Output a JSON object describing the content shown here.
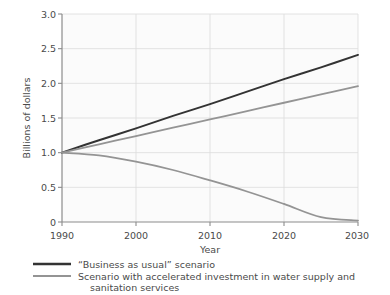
{
  "chart_data": {
    "type": "line",
    "title": "",
    "subtitle": "",
    "xlabel": "Year",
    "ylabel": "Billions of dollars",
    "xlim": [
      1990,
      2030
    ],
    "ylim": [
      0,
      3.0
    ],
    "grid": true,
    "legend_position": "bottom-left",
    "x_ticks": [
      "1990",
      "2000",
      "2010",
      "2020",
      "2030"
    ],
    "x_tick_values": [
      1990,
      2000,
      2010,
      2020,
      2030
    ],
    "y_ticks": [
      "0",
      "0.5",
      "1.0",
      "1.5",
      "2.0",
      "2.5",
      "3.0"
    ],
    "y_tick_values": [
      0,
      0.5,
      1.0,
      1.5,
      2.0,
      2.5,
      3.0
    ],
    "x": [
      1990,
      1995,
      2000,
      2005,
      2010,
      2015,
      2020,
      2025,
      2030
    ],
    "series": [
      {
        "name": "“Business as usual” scenario",
        "color": "#333333",
        "width": 2.0,
        "values": [
          1.0,
          1.18,
          1.35,
          1.53,
          1.7,
          1.88,
          2.06,
          2.23,
          2.41
        ]
      },
      {
        "name": "Scenario with accelerated investment in water supply and sanitation services",
        "color": "#949494",
        "width": 1.8,
        "values": [
          1.0,
          1.12,
          1.24,
          1.36,
          1.48,
          1.6,
          1.72,
          1.84,
          1.96
        ],
        "legend_only": true
      },
      {
        "name": "Scenario with accelerated investment in water supply and sanitation services (declining)",
        "color": "#949494",
        "width": 1.8,
        "values": [
          1.0,
          0.96,
          0.87,
          0.75,
          0.6,
          0.44,
          0.26,
          0.07,
          0.02
        ],
        "legend_hidden": true
      }
    ],
    "annotations": []
  },
  "axes": {
    "y_label": "Billions of dollars",
    "x_label": "Year",
    "y_tick_0": "0",
    "y_tick_1": "0.5",
    "y_tick_2": "1.0",
    "y_tick_3": "1.5",
    "y_tick_4": "2.0",
    "y_tick_5": "2.5",
    "y_tick_6": "3.0",
    "x_tick_0": "1990",
    "x_tick_1": "2000",
    "x_tick_2": "2010",
    "x_tick_3": "2020",
    "x_tick_4": "2030"
  },
  "legend": {
    "item1": {
      "label": "“Business as usual” scenario",
      "color": "#333333"
    },
    "item2": {
      "label_line1": "Scenario with accelerated investment in water supply and",
      "label_line2": "sanitation services",
      "color": "#949494"
    }
  },
  "colors": {
    "background": "#ffffff",
    "plot_background": "#fbfbfb",
    "grid": "#dcdcdc",
    "axis": "#8c8c8c",
    "text": "#4a4a4a",
    "series_dark": "#333333",
    "series_gray": "#949494"
  }
}
